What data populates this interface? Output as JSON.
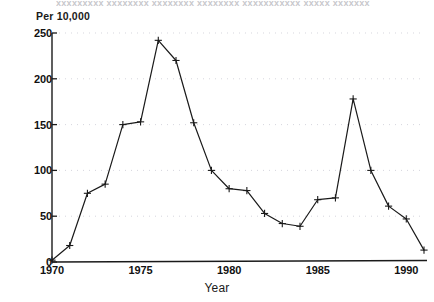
{
  "figure": {
    "title_remnant": "xxxxxxxxx xxxxxxxx xxxxxxxx xxxxxxxx xxxxxxxxxxx xxxxx xxxxxxx",
    "background_color": "#ffffff",
    "ink_color": "#1a1a1a",
    "grid_color": "#c9c9d2"
  },
  "chart_data": {
    "type": "line",
    "title": "",
    "xlabel": "Year",
    "ylabel": "Per 10,000",
    "ylabel_position": "top-left",
    "x": [
      1970,
      1971,
      1972,
      1973,
      1974,
      1975,
      1976,
      1977,
      1978,
      1979,
      1980,
      1981,
      1982,
      1983,
      1984,
      1985,
      1986,
      1987,
      1988,
      1989,
      1990,
      1991
    ],
    "values": [
      2,
      18,
      75,
      85,
      150,
      153,
      242,
      220,
      152,
      100,
      80,
      78,
      53,
      42,
      39,
      68,
      70,
      178,
      100,
      61,
      47,
      13
    ],
    "xlim": [
      1970,
      1991
    ],
    "ylim": [
      0,
      250
    ],
    "xticks": [
      1970,
      1975,
      1980,
      1985,
      1990
    ],
    "xtick_labels": [
      "1970",
      "1975",
      "1980",
      "1985",
      "1990"
    ],
    "yticks": [
      0,
      50,
      100,
      150,
      200,
      250
    ],
    "ytick_labels": [
      "0",
      "50",
      "100",
      "150",
      "200",
      "250"
    ],
    "grid": true,
    "grid_style": "dotted-faint-horizontal",
    "legend": null,
    "marker": "plus",
    "line_color": "#1a1a1a",
    "line_width": 1.2
  }
}
